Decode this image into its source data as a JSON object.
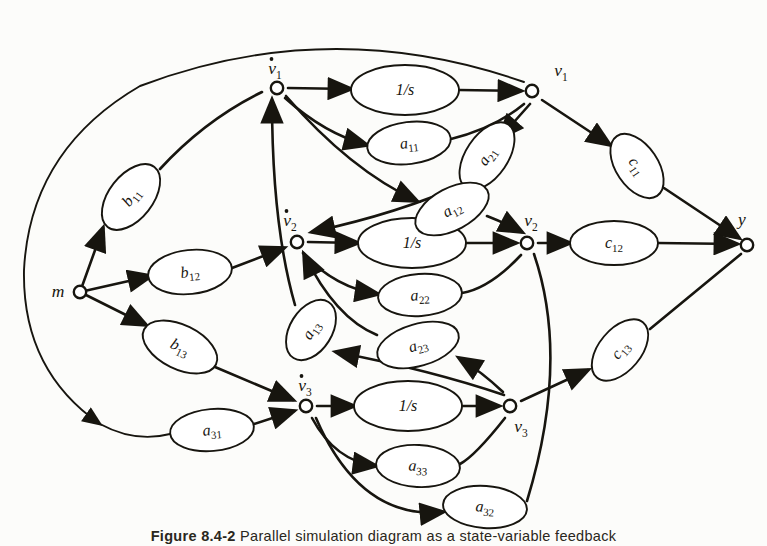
{
  "figure": {
    "domain_label": "signal-flow-graph",
    "caption_prefix": "Figure",
    "caption_number": "8.4-2",
    "caption_text": "Parallel simulation diagram as a state-variable feedback"
  },
  "nodes": [
    {
      "id": "m",
      "label": "m",
      "sub": "",
      "dot": false,
      "x": 80,
      "y": 292,
      "lx": 58,
      "ly": 297,
      "name": "node-m"
    },
    {
      "id": "v1d",
      "label": "v",
      "sub": "1",
      "dot": true,
      "x": 277,
      "y": 88,
      "lx": 275,
      "ly": 74,
      "name": "node-v1-dot"
    },
    {
      "id": "v1",
      "label": "v",
      "sub": "1",
      "dot": false,
      "x": 532,
      "y": 91,
      "lx": 561,
      "ly": 76,
      "name": "node-v1"
    },
    {
      "id": "v2d",
      "label": "v",
      "sub": "2",
      "dot": true,
      "x": 297,
      "y": 242,
      "lx": 290,
      "ly": 226,
      "name": "node-v2-dot"
    },
    {
      "id": "v2",
      "label": "v",
      "sub": "2",
      "dot": false,
      "x": 527,
      "y": 243,
      "lx": 531,
      "ly": 226,
      "name": "node-v2"
    },
    {
      "id": "v3d",
      "label": "v",
      "sub": "3",
      "dot": true,
      "x": 306,
      "y": 406,
      "lx": 305,
      "ly": 391,
      "name": "node-v3-dot"
    },
    {
      "id": "v3",
      "label": "v",
      "sub": "3",
      "dot": false,
      "x": 510,
      "y": 406,
      "lx": 521,
      "ly": 432,
      "name": "node-v3"
    },
    {
      "id": "y",
      "label": "y",
      "sub": "",
      "dot": false,
      "x": 747,
      "y": 245,
      "lx": 742,
      "ly": 225,
      "name": "node-y"
    }
  ],
  "gains": [
    {
      "id": "int1",
      "label": "1/s",
      "sub": "",
      "x": 405,
      "y": 90,
      "rx": 54,
      "ry": 25,
      "rot": 0,
      "name": "gain-integrator-1"
    },
    {
      "id": "int2",
      "label": "1/s",
      "sub": "",
      "x": 412,
      "y": 243,
      "rx": 54,
      "ry": 25,
      "rot": 0,
      "name": "gain-integrator-2"
    },
    {
      "id": "int3",
      "label": "1/s",
      "sub": "",
      "x": 408,
      "y": 406,
      "rx": 54,
      "ry": 25,
      "rot": 0,
      "name": "gain-integrator-3"
    },
    {
      "id": "b11",
      "label": "b",
      "sub": "11",
      "x": 131,
      "y": 197,
      "rx": 38,
      "ry": 22,
      "rot": -52,
      "name": "gain-b11"
    },
    {
      "id": "b12",
      "label": "b",
      "sub": "12",
      "x": 190,
      "y": 272,
      "rx": 42,
      "ry": 22,
      "rot": -6,
      "name": "gain-b12"
    },
    {
      "id": "b13",
      "label": "b",
      "sub": "13",
      "x": 180,
      "y": 347,
      "rx": 40,
      "ry": 22,
      "rot": 26,
      "name": "gain-b13"
    },
    {
      "id": "a11",
      "label": "a",
      "sub": "11",
      "x": 409,
      "y": 143,
      "rx": 42,
      "ry": 21,
      "rot": -7,
      "name": "gain-a11"
    },
    {
      "id": "a21",
      "label": "a",
      "sub": "21",
      "x": 487,
      "y": 156,
      "rx": 38,
      "ry": 21,
      "rot": -56,
      "name": "gain-a21"
    },
    {
      "id": "a12",
      "label": "a",
      "sub": "12",
      "x": 452,
      "y": 209,
      "rx": 40,
      "ry": 21,
      "rot": -28,
      "name": "gain-a12"
    },
    {
      "id": "a22",
      "label": "a",
      "sub": "22",
      "x": 420,
      "y": 295,
      "rx": 42,
      "ry": 21,
      "rot": -4,
      "name": "gain-a22"
    },
    {
      "id": "a13",
      "label": "a",
      "sub": "13",
      "x": 311,
      "y": 330,
      "rx": 33,
      "ry": 21,
      "rot": -58,
      "name": "gain-a13"
    },
    {
      "id": "a23",
      "label": "a",
      "sub": "23",
      "x": 418,
      "y": 345,
      "rx": 42,
      "ry": 21,
      "rot": -16,
      "name": "gain-a23"
    },
    {
      "id": "a31",
      "label": "a",
      "sub": "31",
      "x": 212,
      "y": 430,
      "rx": 42,
      "ry": 21,
      "rot": -5,
      "name": "gain-a31"
    },
    {
      "id": "a33",
      "label": "a",
      "sub": "33",
      "x": 418,
      "y": 466,
      "rx": 42,
      "ry": 21,
      "rot": 3,
      "name": "gain-a33"
    },
    {
      "id": "a32",
      "label": "a",
      "sub": "32",
      "x": 485,
      "y": 507,
      "rx": 42,
      "ry": 21,
      "rot": 4,
      "name": "gain-a32"
    },
    {
      "id": "c11",
      "label": "c",
      "sub": "11",
      "x": 637,
      "y": 166,
      "rx": 36,
      "ry": 21,
      "rot": 56,
      "name": "gain-c11"
    },
    {
      "id": "c12",
      "label": "c",
      "sub": "12",
      "x": 614,
      "y": 243,
      "rx": 44,
      "ry": 22,
      "rot": 0,
      "name": "gain-c12"
    },
    {
      "id": "c13",
      "label": "c",
      "sub": "13",
      "x": 620,
      "y": 350,
      "rx": 36,
      "ry": 21,
      "rot": -50,
      "name": "gain-c13"
    }
  ],
  "colors": {
    "ink": "#17150f",
    "paper": "#fcfcfa",
    "node_fill": "#ffffff"
  }
}
